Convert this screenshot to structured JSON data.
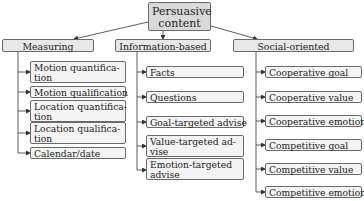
{
  "root": {
    "label_line1": "Persuasive",
    "label_line2": "content"
  },
  "categories": [
    {
      "label": "Measuring",
      "children": [
        {
          "label": "Motion quantifica-",
          "label2": "tion"
        },
        {
          "label": "Motion qualification"
        },
        {
          "label": "Location quantifica-",
          "label2": "tion"
        },
        {
          "label": "Location qualifica-",
          "label2": "tion"
        },
        {
          "label": "Calendar/date"
        }
      ]
    },
    {
      "label": "Information-based",
      "children": [
        {
          "label": "Facts"
        },
        {
          "label": "Questions"
        },
        {
          "label": "Goal-targeted advise"
        },
        {
          "label": "Value-targeted ad-",
          "label2": "vise"
        },
        {
          "label": "Emotion-targeted",
          "label2": "advise"
        }
      ]
    },
    {
      "label": "Social-oriented",
      "children": [
        {
          "label": "Cooperative goal"
        },
        {
          "label": "Cooperative value"
        },
        {
          "label": "Cooperative emotion"
        },
        {
          "label": "Competitive goal"
        },
        {
          "label": "Competitive value"
        },
        {
          "label": "Competitive emotion"
        }
      ]
    }
  ],
  "colors": {
    "root_fill": "#d9d9d9",
    "category_fill": "#e8e8e8",
    "leaf_fill": "#f4f4f4",
    "stroke": "#6a6a6a"
  }
}
